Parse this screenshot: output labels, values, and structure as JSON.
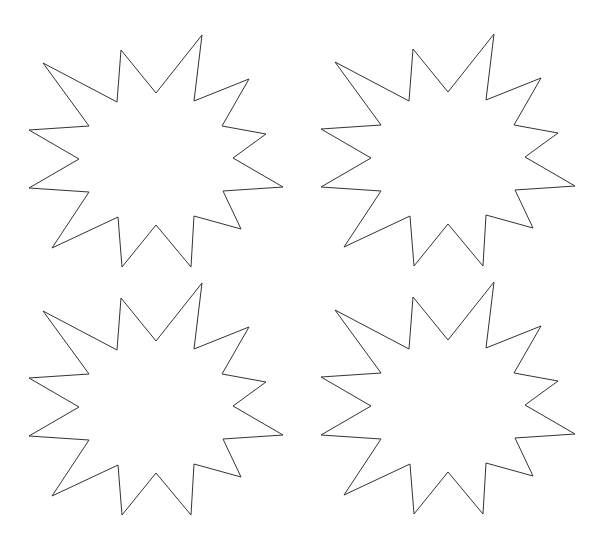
{
  "canvas": {
    "width": 608,
    "height": 552,
    "background": "#ffffff"
  },
  "style": {
    "stroke": "#333333",
    "fill": "#ffffff",
    "stroke_width": 1
  },
  "shape": {
    "name": "starburst",
    "points": 12,
    "vertices": [
      [
        43,
        63
      ],
      [
        89,
        126
      ],
      [
        29,
        130
      ],
      [
        79,
        159
      ],
      [
        29,
        188
      ],
      [
        89,
        192
      ],
      [
        52,
        248
      ],
      [
        118,
        217
      ],
      [
        122,
        267
      ],
      [
        156,
        225
      ],
      [
        191,
        267
      ],
      [
        194,
        216
      ],
      [
        241,
        229
      ],
      [
        223,
        191
      ],
      [
        283,
        187
      ],
      [
        233,
        158
      ],
      [
        266,
        134
      ],
      [
        222,
        126
      ],
      [
        249,
        79
      ],
      [
        194,
        101
      ],
      [
        202,
        35
      ],
      [
        156,
        93
      ],
      [
        121,
        50
      ],
      [
        117,
        102
      ]
    ]
  },
  "bursts": [
    {
      "id": "starburst-top-left",
      "dx": 0,
      "dy": 0
    },
    {
      "id": "starburst-top-right",
      "dx": 292,
      "dy": -1
    },
    {
      "id": "starburst-bottom-left",
      "dx": 0,
      "dy": 248
    },
    {
      "id": "starburst-bottom-right",
      "dx": 292,
      "dy": 247
    }
  ]
}
